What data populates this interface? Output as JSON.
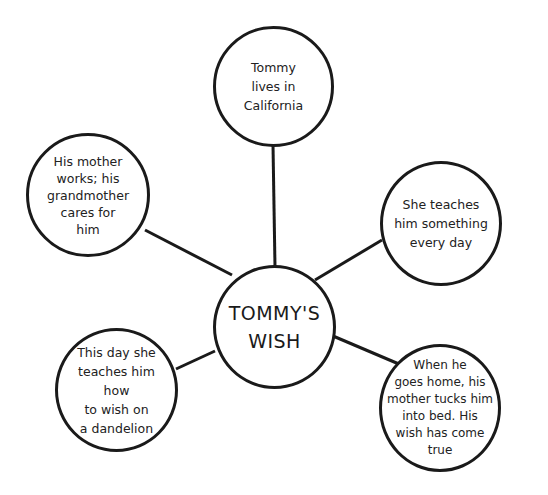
{
  "title": "TOMMY'S WISH",
  "center": {
    "text": "TOMMY'S WISH",
    "line1": "TOMMY'S",
    "line2": "WISH"
  },
  "nodes": [
    {
      "id": "top",
      "text": "Tommy lives in California",
      "lines": [
        "Tommy",
        "lives in",
        "California"
      ]
    },
    {
      "id": "left-top",
      "text": "His mother works; his grandmother cares for him",
      "lines": [
        "His mother",
        "works; his",
        "grandmother",
        "cares for",
        "him"
      ]
    },
    {
      "id": "right-top",
      "text": "She teaches him something every day",
      "lines": [
        "She teaches",
        "him something",
        "every day"
      ]
    },
    {
      "id": "left-bottom",
      "text": "This day she teaches him how to wish on a dandelion",
      "lines": [
        "This day she",
        "teaches him how",
        "to wish on",
        "a dandelion"
      ]
    },
    {
      "id": "right-bottom",
      "text": "When he goes home, his mother tucks him into bed. His wish has come true",
      "lines": [
        "When he",
        "goes home, his",
        "mother tucks him",
        "into bed. His",
        "wish has come",
        "true"
      ]
    }
  ],
  "colors": {
    "stroke": "#1a1a1a",
    "background": "#ffffff",
    "text": "#222222"
  }
}
